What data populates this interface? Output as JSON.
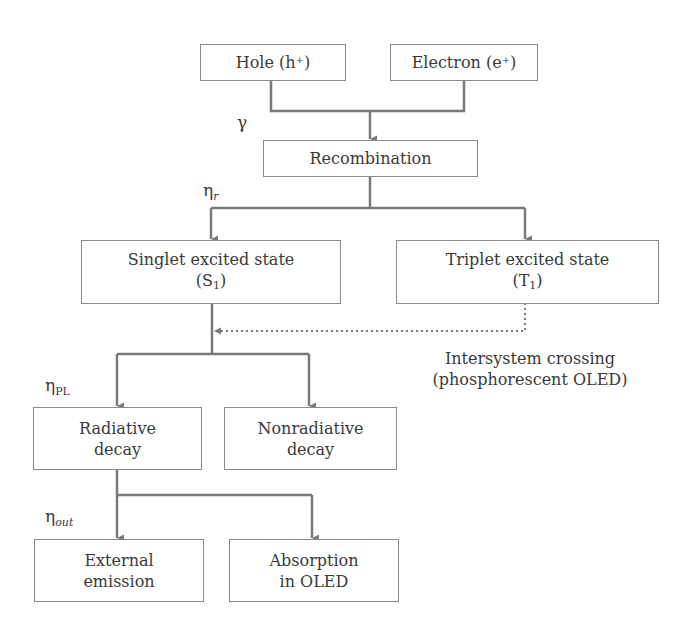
{
  "nodes": {
    "hole": {
      "label": "Hole (h⁺)"
    },
    "electron": {
      "label": "Electron (e⁺)"
    },
    "recombination": {
      "label": "Recombination"
    },
    "singlet": {
      "line1": "Singlet excited state",
      "sym": "S",
      "sub": "1"
    },
    "triplet": {
      "line1": "Triplet excited state",
      "sym": "T",
      "sub": "1"
    },
    "radiative": {
      "line1": "Radiative",
      "line2": "decay"
    },
    "nonradiative": {
      "line1": "Nonradiative",
      "line2": "decay"
    },
    "external": {
      "line1": "External",
      "line2": "emission"
    },
    "absorption": {
      "line1": "Absorption",
      "line2": "in OLED"
    }
  },
  "labels": {
    "gamma": "γ",
    "eta_r": {
      "base": "η",
      "sub": "r"
    },
    "eta_pl": {
      "base": "η",
      "sub": "PL"
    },
    "eta_out": {
      "base": "η",
      "sub": "out"
    }
  },
  "intersystem": {
    "line1": "Intersystem crossing",
    "line2": "(phosphorescent OLED)"
  },
  "colors": {
    "line": "#7a7a7a",
    "border": "#8a8a8a",
    "text": "#3a3a3a"
  }
}
